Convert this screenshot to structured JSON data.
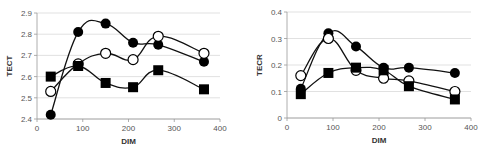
{
  "chart_data": [
    {
      "type": "line",
      "title": "",
      "xlabel": "DIM",
      "ylabel": "TECT",
      "xlim": [
        0,
        400
      ],
      "ylim": [
        2.4,
        2.9
      ],
      "xticks": [
        0,
        100,
        200,
        300,
        400
      ],
      "yticks": [
        2.4,
        2.5,
        2.6,
        2.7,
        2.8,
        2.9
      ],
      "grid": true,
      "smooth": true,
      "x": [
        30,
        90,
        150,
        210,
        265,
        365
      ],
      "series": [
        {
          "name": "filled-circle",
          "marker": "circle-filled",
          "values": [
            2.42,
            2.81,
            2.85,
            2.76,
            2.75,
            2.67
          ]
        },
        {
          "name": "open-circle",
          "marker": "circle-open",
          "values": [
            2.53,
            2.66,
            2.71,
            2.68,
            2.79,
            2.71
          ]
        },
        {
          "name": "filled-square",
          "marker": "square-filled",
          "values": [
            2.6,
            2.65,
            2.57,
            2.55,
            2.63,
            2.54
          ]
        }
      ]
    },
    {
      "type": "line",
      "title": "",
      "xlabel": "DIM",
      "ylabel": "TECR",
      "xlim": [
        0,
        400
      ],
      "ylim": [
        0,
        0.4
      ],
      "xticks": [
        0,
        100,
        200,
        300,
        400
      ],
      "yticks": [
        0,
        0.1,
        0.2,
        0.3,
        0.4
      ],
      "grid": true,
      "smooth": true,
      "x": [
        30,
        90,
        150,
        210,
        265,
        365
      ],
      "series": [
        {
          "name": "filled-circle",
          "marker": "circle-filled",
          "values": [
            0.11,
            0.32,
            0.27,
            0.19,
            0.19,
            0.17
          ]
        },
        {
          "name": "open-circle",
          "marker": "circle-open",
          "values": [
            0.16,
            0.3,
            0.18,
            0.15,
            0.14,
            0.1
          ]
        },
        {
          "name": "filled-square",
          "marker": "square-filled",
          "values": [
            0.09,
            0.17,
            0.19,
            0.18,
            0.12,
            0.07
          ]
        }
      ]
    }
  ],
  "layout": {
    "charts": [
      {
        "x0": 37,
        "x1": 220,
        "yTop": 13,
        "yBot": 119
      },
      {
        "x0": 287,
        "x1": 471,
        "yTop": 12,
        "yBot": 118
      }
    ]
  }
}
